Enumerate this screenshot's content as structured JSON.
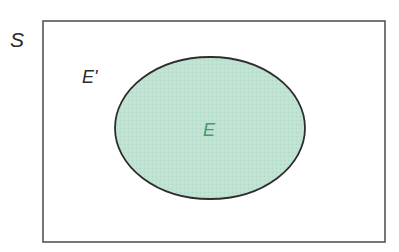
{
  "diagram": {
    "type": "venn",
    "universe": {
      "label": "S",
      "rect": {
        "x": 43,
        "y": 21,
        "width": 342,
        "height": 221
      },
      "stroke": "#555555",
      "fill": "#ffffff"
    },
    "complement": {
      "label": "E'"
    },
    "event": {
      "label": "E",
      "ellipse": {
        "cx": 210,
        "cy": 128,
        "rx": 95,
        "ry": 71
      },
      "fill": "#bfe3d2",
      "stroke": "#2e2e2e",
      "label_color": "#4a9a68"
    }
  }
}
